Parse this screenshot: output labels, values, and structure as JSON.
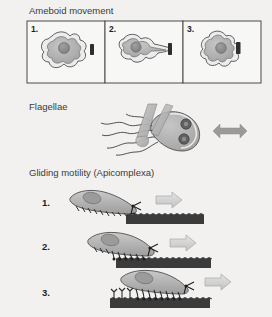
{
  "figure": {
    "background_color": "#f2f1ef",
    "sections": [
      {
        "id": "ameboid",
        "title": "Ameboid movement",
        "panels": [
          {
            "number": "1.",
            "caption_id": "ameboid-panel-1"
          },
          {
            "number": "2.",
            "caption_id": "ameboid-panel-2"
          },
          {
            "number": "3.",
            "caption_id": "ameboid-panel-3"
          }
        ]
      },
      {
        "id": "flagellae",
        "title": "Flagellae"
      },
      {
        "id": "gliding",
        "title": "Gliding motility (Apicomplexa)",
        "steps": [
          {
            "number": "1."
          },
          {
            "number": "2."
          },
          {
            "number": "3."
          }
        ]
      }
    ]
  },
  "labels": {
    "ameboid_title": "Ameboid movement",
    "flagellae_title": "Flagellae",
    "gliding_title": "Gliding motility (Apicomplexa)",
    "panel_1": "1.",
    "panel_2": "2.",
    "panel_3": "3.",
    "step_1": "1.",
    "step_2": "2.",
    "step_3": "3."
  },
  "colors": {
    "background": "#f2f1ef",
    "cell_fill": "#b4b4b4",
    "cell_inner": "#9b9b9b",
    "cell_outline": "#555555",
    "cell_membrane": "#e8e8e8",
    "nucleus": "#8a8a8a",
    "substrate_dark": "#3b3b3b",
    "arrow_gray": "#9a9a9a",
    "arrow_light": "#d2d2d2",
    "bar_dark": "#2e2e2e",
    "panel_border": "#4a4a4a",
    "text": "#3a3a3a"
  },
  "icons": {
    "double_arrow": "double-headed-arrow-icon",
    "motion_arrow": "right-arrow-icon",
    "nucleus": "nucleus-icon",
    "flagellum": "flagellum-icon",
    "adhesin": "adhesin-link-icon"
  }
}
